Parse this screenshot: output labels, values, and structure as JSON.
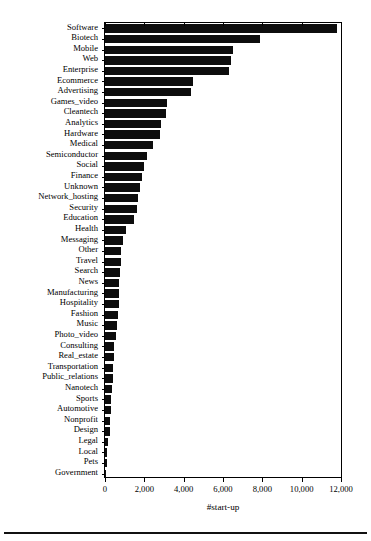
{
  "chart_data": {
    "type": "bar",
    "orientation": "horizontal",
    "title": "",
    "subtitle": "",
    "xlabel": "#start-up",
    "ylabel": "",
    "xlim": [
      0,
      12000
    ],
    "ylim": null,
    "grid": false,
    "legend": null,
    "bar_color": "#0d0d0d",
    "axis_color": "#000000",
    "background_color": "#ffffff",
    "xticks": [
      0,
      2000,
      4000,
      6000,
      8000,
      10000,
      12000
    ],
    "xtick_labels": [
      "0",
      "2,000",
      "4,000",
      "6,000",
      "8,000",
      "10,000",
      "12,000"
    ],
    "categories": [
      "Software",
      "Biotech",
      "Mobile",
      "Web",
      "Enterprise",
      "Ecommerce",
      "Advertising",
      "Games_video",
      "Cleantech",
      "Analytics",
      "Hardware",
      "Medical",
      "Semiconductor",
      "Social",
      "Finance",
      "Unknown",
      "Network_hosting",
      "Security",
      "Education",
      "Health",
      "Messaging",
      "Other",
      "Travel",
      "Search",
      "News",
      "Manufacturing",
      "Hospitality",
      "Fashion",
      "Music",
      "Photo_video",
      "Consulting",
      "Real_estate",
      "Transportation",
      "Public_relations",
      "Nanotech",
      "Sports",
      "Automotive",
      "Nonprofit",
      "Design",
      "Legal",
      "Local",
      "Pets",
      "Government"
    ],
    "values": [
      11800,
      7900,
      6500,
      6400,
      6300,
      4450,
      4350,
      3150,
      3100,
      2850,
      2800,
      2450,
      2150,
      2000,
      1880,
      1790,
      1700,
      1650,
      1480,
      1050,
      930,
      830,
      800,
      760,
      720,
      700,
      690,
      660,
      590,
      560,
      480,
      470,
      400,
      390,
      380,
      320,
      280,
      270,
      230,
      130,
      110,
      90,
      40
    ]
  }
}
